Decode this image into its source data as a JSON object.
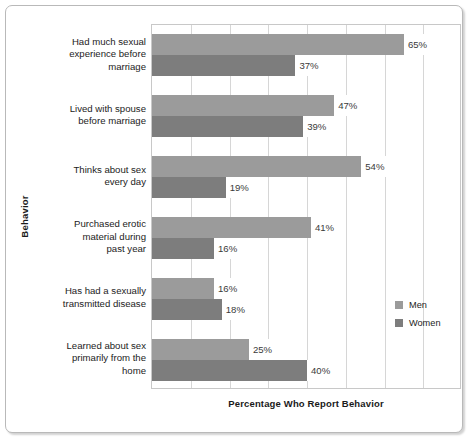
{
  "chart_data": {
    "type": "bar",
    "orientation": "horizontal",
    "title": "",
    "xlabel": "Percentage Who Report Behavior",
    "ylabel": "Behavior",
    "xlim": [
      0,
      80
    ],
    "grid": true,
    "grid_step": 10,
    "legend_position": "right-middle",
    "unit": "%",
    "categories": [
      "Had much sexual experience before marriage",
      "Lived with spouse before marriage",
      "Thinks about sex every day",
      "Purchased erotic material during past year",
      "Has had a sexually transmitted disease",
      "Learned about sex primarily from the home"
    ],
    "series": [
      {
        "name": "Men",
        "color": "#9b9b9b",
        "values": [
          65,
          47,
          54,
          41,
          16,
          25
        ]
      },
      {
        "name": "Women",
        "color": "#7d7d7d",
        "values": [
          37,
          39,
          19,
          16,
          18,
          40
        ]
      }
    ]
  },
  "axes": {
    "y_title": "Behavior",
    "x_title": "Percentage Who Report Behavior"
  },
  "categories": [
    {
      "lines": [
        "Had much sexual",
        "experience before",
        "marriage"
      ]
    },
    {
      "lines": [
        "Lived with spouse",
        "before marriage"
      ]
    },
    {
      "lines": [
        "Thinks about sex",
        "every day"
      ]
    },
    {
      "lines": [
        "Purchased erotic",
        "material during",
        "past year"
      ]
    },
    {
      "lines": [
        "Has had a sexually",
        "transmitted disease"
      ]
    },
    {
      "lines": [
        "Learned about sex",
        "primarily from the",
        "home"
      ]
    }
  ],
  "labels": {
    "men": [
      "65%",
      "47%",
      "54%",
      "41%",
      "16%",
      "25%"
    ],
    "women": [
      "37%",
      "39%",
      "19%",
      "16%",
      "18%",
      "40%"
    ]
  },
  "legend": {
    "items": [
      {
        "label": "Men",
        "color": "#9b9b9b"
      },
      {
        "label": "Women",
        "color": "#7d7d7d"
      }
    ]
  }
}
